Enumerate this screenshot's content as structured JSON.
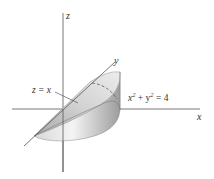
{
  "figure": {
    "axes": {
      "x_label": "x",
      "y_label": "y",
      "z_label": "z"
    },
    "annotations": {
      "plane": "z = x",
      "cylinder_base": "x",
      "cylinder_sup": "2",
      "cylinder_mid": " + y",
      "cylinder_sup2": "2",
      "cylinder_rhs": " = 4"
    },
    "colors": {
      "axis": "#555555",
      "surface_light": "#f0f0f0",
      "surface_mid": "#cfcfcf",
      "surface_dark": "#9a9a9a",
      "label": "#333333"
    }
  }
}
